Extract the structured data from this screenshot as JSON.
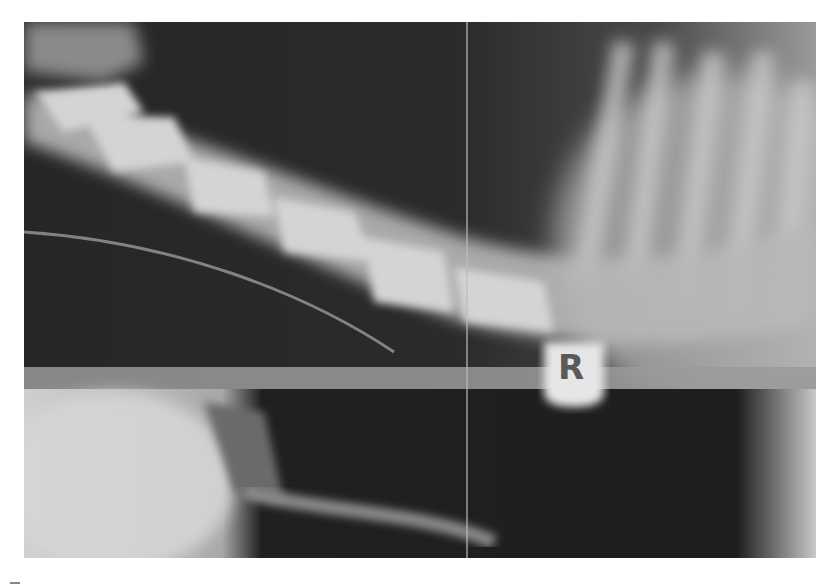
{
  "image": {
    "description": "Lateral radiograph of cervical spine (animal), right-side marker",
    "marker": {
      "label": "R"
    },
    "colors": {
      "background": "#ffffff",
      "film_dark": "#2a2a2a",
      "bone": "#d8d8d8"
    }
  }
}
